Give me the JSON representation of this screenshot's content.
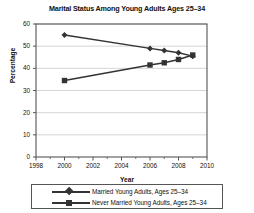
{
  "chart_data": {
    "type": "line",
    "title": "Marital Status Among Young Adults Ages 25–34",
    "xlabel": "Year",
    "ylabel": "Percentage",
    "xlim": [
      1998,
      2010
    ],
    "ylim": [
      0,
      60
    ],
    "xticks": [
      1998,
      2000,
      2002,
      2004,
      2006,
      2008,
      2010
    ],
    "yticks": [
      0,
      10,
      20,
      30,
      40,
      50,
      60
    ],
    "xtick_labels": [
      "1998",
      "2000",
      "2002",
      "2004",
      "2006",
      "2008",
      "2010"
    ],
    "ytick_labels": [
      "0",
      "10",
      "20",
      "30",
      "40",
      "50",
      "60"
    ],
    "grid": "horizontal",
    "legend_position": "below",
    "x": [
      2000,
      2006,
      2007,
      2008,
      2009
    ],
    "series": [
      {
        "name": "Married Young Adults, Ages 25–34",
        "marker": "diamond",
        "color": "#333333",
        "x": [
          2000,
          2006,
          2007,
          2008,
          2009
        ],
        "values": [
          55,
          49,
          48,
          47,
          45.5
        ]
      },
      {
        "name": "Never Married Young Adults, Ages 25–34",
        "marker": "square",
        "color": "#333333",
        "x": [
          2000,
          2006,
          2007,
          2008,
          2009
        ],
        "values": [
          34.5,
          41.5,
          42.5,
          44,
          46
        ]
      }
    ]
  },
  "legend": {
    "entries": [
      "Married Young Adults, Ages 25–34",
      "Never Married Young Adults, Ages 25–34"
    ]
  },
  "colors": {
    "ink": "#333333",
    "grid": "#cccccc",
    "frame": "#555555",
    "background": "#ffffff"
  }
}
